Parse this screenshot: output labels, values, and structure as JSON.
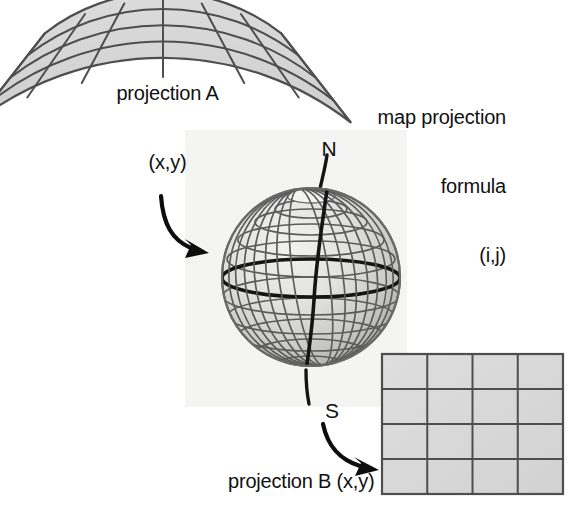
{
  "diagram": {
    "title_semantics": "map projection transformation diagram",
    "labels": {
      "projection_a": "projection A\n(x,y)",
      "projection_a_line1": "projection A",
      "projection_a_line2": "(x,y)",
      "map_formula": "map projection\nformula\n(i,j)",
      "map_formula_line1": "map projection",
      "map_formula_line2": "formula",
      "map_formula_line3": "(i,j)",
      "projection_b": "projection B (x,y)",
      "north_pole": "N",
      "south_pole": "S"
    },
    "colors": {
      "fill_gray": "#d5d5d5",
      "grid_line": "#555555",
      "bold_line": "#141414",
      "text": "#111111",
      "backing": "#f4f4f2",
      "globe_light": "#ededec",
      "globe_mid": "#d2d2d1",
      "globe_dark": "#a9a9a8",
      "background": "#ffffff"
    },
    "conic_projection": {
      "name": "projection-a-conic-fan",
      "rows": 4,
      "columns": 6,
      "arc_count": 5,
      "radial_count": 7,
      "apex_x": 163,
      "apex_y": -118,
      "inner_radius": 192,
      "outer_radius": 305,
      "angle_start_deg": -38,
      "angle_end_deg": 38
    },
    "globe": {
      "name": "globe-sphere",
      "center_x": 311,
      "center_y": 277,
      "radius": 89,
      "parallels": 9,
      "meridians": 12,
      "bold_equator": true,
      "bold_prime_meridian": true,
      "polar_cap_visible": true
    },
    "grid_projection": {
      "name": "projection-b-grid",
      "left": 382,
      "top": 354,
      "width": 181,
      "height": 140,
      "rows": 4,
      "columns": 4
    },
    "arrows": [
      {
        "name": "arrow-conic-to-globe",
        "from": "projection A fan",
        "to": "globe"
      },
      {
        "name": "arrow-globe-to-grid",
        "from": "globe south pole",
        "to": "projection B grid"
      }
    ]
  }
}
